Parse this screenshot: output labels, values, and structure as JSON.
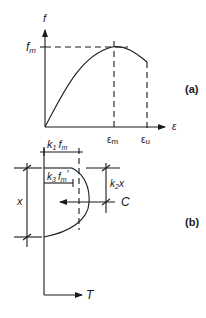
{
  "panel_a": {
    "label": "(a)",
    "y_axis_label": "f",
    "x_axis_label": "ε",
    "peak_label_main": "f",
    "peak_label_sub": "m",
    "eps_m_main": "ε",
    "eps_m_sub": "m",
    "eps_u_main": "ε",
    "eps_u_sub": "u"
  },
  "panel_b": {
    "label": "(b)",
    "k1": {
      "k": "k",
      "k_sub": "1",
      "f": "f",
      "f_sub": "m"
    },
    "k3": {
      "k": "k",
      "k_sub": "3",
      "f": "f",
      "f_sub": "m",
      "prime": "'"
    },
    "k2x": {
      "k": "k",
      "k_sub": "2",
      "x": "x"
    },
    "depth_label": "x",
    "compression_label": "C",
    "tension_label": "T"
  },
  "colors": {
    "ink": "#1a1a1a",
    "background": "#ffffff"
  }
}
